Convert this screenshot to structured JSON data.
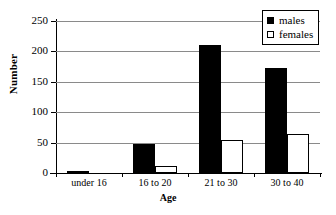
{
  "chart_data": {
    "type": "bar",
    "title": "",
    "xlabel": "Age",
    "ylabel": "Number",
    "categories": [
      "under 16",
      "16 to 20",
      "21 to 30",
      "30 to 40"
    ],
    "series": [
      {
        "name": "males",
        "values": [
          3,
          47,
          210,
          173
        ],
        "color": "#000000"
      },
      {
        "name": "females",
        "values": [
          0,
          12,
          54,
          64
        ],
        "color": "#ffffff"
      }
    ],
    "ylim": [
      0,
      250
    ],
    "yticks": [
      0,
      50,
      100,
      150,
      200,
      250
    ],
    "ytick_labels": [
      "0",
      "50",
      "100",
      "150",
      "200",
      "250"
    ],
    "grid": true,
    "legend_position": "top-right",
    "legend_entries": [
      "males",
      "females"
    ]
  },
  "axes": {
    "y_title": "Number",
    "x_title": "Age"
  },
  "legend": {
    "males_label": "males",
    "females_label": "females"
  }
}
